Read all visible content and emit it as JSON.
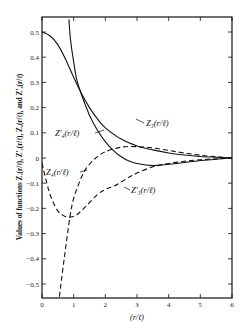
{
  "chart_data": {
    "type": "line",
    "title": "",
    "xlabel": "(r/ℓ)",
    "ylabel": "Values of functions Z3(r/ℓ), Z3'(r/ℓ), Z4(r/ℓ), and Z4'(r/ℓ)",
    "xlim": [
      0,
      6
    ],
    "ylim": [
      -0.55,
      0.55
    ],
    "grid": false,
    "legend": "none (inline curve labels)",
    "x_ticks": [
      "0",
      "1",
      "2",
      "3",
      "4",
      "5",
      "6"
    ],
    "y_ticks": [
      "0.5",
      "0.4",
      "0.3",
      "0.2",
      "0.1",
      "0",
      "-0.1",
      "-0.2",
      "-0.3",
      "-0.4",
      "-0.5"
    ],
    "series": [
      {
        "name": "Z3(r/ℓ)",
        "style": "solid",
        "points": [
          [
            0,
            0.5
          ],
          [
            0.25,
            0.485
          ],
          [
            0.5,
            0.45
          ],
          [
            0.75,
            0.39
          ],
          [
            1.0,
            0.32
          ],
          [
            1.25,
            0.255
          ],
          [
            1.5,
            0.2
          ],
          [
            1.75,
            0.155
          ],
          [
            2.0,
            0.12
          ],
          [
            2.5,
            0.075
          ],
          [
            3.0,
            0.048
          ],
          [
            3.5,
            0.032
          ],
          [
            4.0,
            0.02
          ],
          [
            4.5,
            0.012
          ],
          [
            5.0,
            0.006
          ],
          [
            5.5,
            0.003
          ],
          [
            6.0,
            0.0
          ]
        ]
      },
      {
        "name": "Z4'(r/ℓ)",
        "style": "solid",
        "points": [
          [
            0.85,
            0.55
          ],
          [
            0.9,
            0.47
          ],
          [
            1.0,
            0.38
          ],
          [
            1.1,
            0.31
          ],
          [
            1.25,
            0.25
          ],
          [
            1.5,
            0.17
          ],
          [
            1.75,
            0.11
          ],
          [
            2.0,
            0.065
          ],
          [
            2.25,
            0.03
          ],
          [
            2.5,
            0.005
          ],
          [
            2.75,
            -0.012
          ],
          [
            3.0,
            -0.022
          ],
          [
            3.5,
            -0.03
          ],
          [
            4.0,
            -0.025
          ],
          [
            4.5,
            -0.018
          ],
          [
            5.0,
            -0.01
          ],
          [
            5.5,
            -0.005
          ],
          [
            6.0,
            0.0
          ]
        ]
      },
      {
        "name": "Z4(r/ℓ)",
        "style": "dashed",
        "points": [
          [
            0.0,
            -0.02
          ],
          [
            0.15,
            -0.1
          ],
          [
            0.3,
            -0.16
          ],
          [
            0.5,
            -0.21
          ],
          [
            0.7,
            -0.23
          ],
          [
            0.88,
            -0.235
          ],
          [
            1.1,
            -0.225
          ],
          [
            1.4,
            -0.19
          ],
          [
            1.75,
            -0.145
          ],
          [
            2.0,
            -0.125
          ],
          [
            2.3,
            -0.11
          ],
          [
            2.7,
            -0.08
          ],
          [
            3.0,
            -0.06
          ],
          [
            3.5,
            -0.035
          ],
          [
            4.0,
            -0.022
          ],
          [
            4.5,
            -0.013
          ],
          [
            5.0,
            -0.007
          ],
          [
            5.5,
            -0.003
          ],
          [
            6.0,
            0.0
          ]
        ]
      },
      {
        "name": "Z3'(r/ℓ)",
        "style": "dashed",
        "points": [
          [
            0.55,
            -0.55
          ],
          [
            0.7,
            -0.4
          ],
          [
            0.88,
            -0.235
          ],
          [
            1.0,
            -0.16
          ],
          [
            1.2,
            -0.09
          ],
          [
            1.4,
            -0.04
          ],
          [
            1.7,
            0.0
          ],
          [
            2.0,
            0.025
          ],
          [
            2.5,
            0.043
          ],
          [
            3.0,
            0.045
          ],
          [
            3.5,
            0.04
          ],
          [
            4.0,
            0.03
          ],
          [
            4.5,
            0.02
          ],
          [
            5.0,
            0.011
          ],
          [
            5.5,
            0.005
          ],
          [
            6.0,
            0.0
          ]
        ]
      }
    ],
    "annotations": [
      {
        "text": "Z3(r/ℓ)",
        "x": 3.0,
        "y": 0.125,
        "arrow_to": [
          2.55,
          0.07
        ]
      },
      {
        "text": "Z'4(r/ℓ)",
        "x": 1.2,
        "y": 0.1,
        "arrow_to": [
          1.9,
          0.1
        ]
      },
      {
        "text": "Z4(r/ℓ)",
        "x": 0.9,
        "y": -0.065,
        "arrow_to": [
          1.35,
          -0.05
        ]
      },
      {
        "text": "Z'3(r/ℓ)",
        "x": 2.6,
        "y": -0.1,
        "arrow_to": [
          2.3,
          -0.1
        ]
      }
    ]
  },
  "labels": {
    "xlabel": "(r/ℓ)",
    "ylabel": "Values of functions Z₃(r/ℓ), Z'₃(r/ℓ), Z₄(r/ℓ), and Z'₄(r/ℓ)",
    "curve_Z3": "Z₃(r/ℓ)",
    "curve_Z4p": "Z'₄(r/ℓ)",
    "curve_Z4": "Z₄(r/ℓ)",
    "curve_Z3p": "Z'₃(r/ℓ)"
  }
}
